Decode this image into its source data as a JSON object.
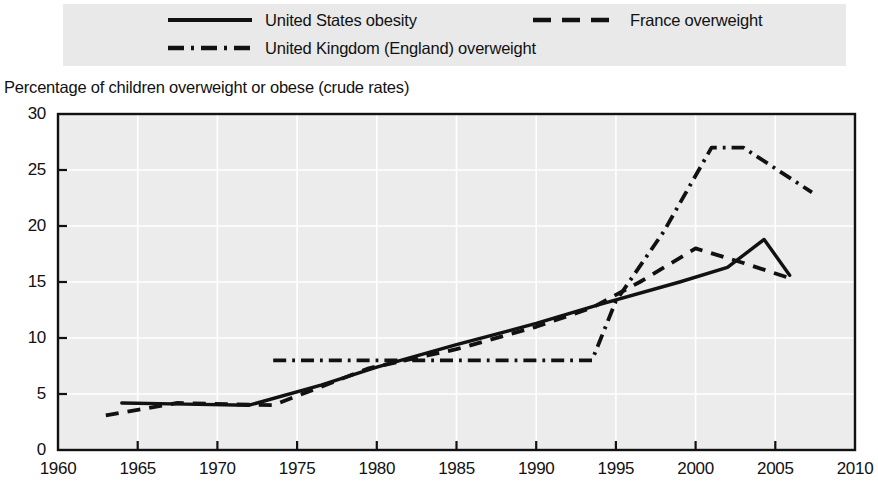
{
  "legend": {
    "entries": [
      {
        "label": "United States obesity",
        "style": "solid",
        "color": "#111111"
      },
      {
        "label": "France overweight",
        "style": "dashed",
        "color": "#111111"
      },
      {
        "label": "United Kingdom (England) overweight",
        "style": "dash-dot",
        "color": "#111111"
      }
    ],
    "background": "#e9e9e9"
  },
  "chart_data": {
    "type": "line",
    "title": "",
    "axis_title": "Percentage of children overweight or obese (crude rates)",
    "xlabel": "",
    "ylabel": "Percentage of children overweight or obese (crude rates)",
    "xlim": [
      1960,
      2010
    ],
    "ylim": [
      0,
      30
    ],
    "xticks": [
      1960,
      1965,
      1970,
      1975,
      1980,
      1985,
      1990,
      1995,
      2000,
      2005,
      2010
    ],
    "yticks": [
      0,
      5,
      10,
      15,
      20,
      25,
      30
    ],
    "grid": true,
    "grid_color": "#ffffff",
    "plot_background": "#ececec",
    "legend_position": "top",
    "series": [
      {
        "name": "United States obesity",
        "style": "solid",
        "color": "#111111",
        "points": [
          [
            1964.0,
            4.2
          ],
          [
            1968.0,
            4.1
          ],
          [
            1972.0,
            4.0
          ],
          [
            1976.5,
            5.8
          ],
          [
            1980.0,
            7.4
          ],
          [
            1985.0,
            9.4
          ],
          [
            1990.0,
            11.3
          ],
          [
            1994.0,
            13.0
          ],
          [
            1999.0,
            15.0
          ],
          [
            2002.0,
            16.3
          ],
          [
            2004.3,
            18.8
          ],
          [
            2005.9,
            15.6
          ]
        ]
      },
      {
        "name": "France overweight",
        "style": "dashed",
        "color": "#111111",
        "points": [
          [
            1963.0,
            3.1
          ],
          [
            1967.5,
            4.2
          ],
          [
            1973.5,
            4.0
          ],
          [
            1979.5,
            7.3
          ],
          [
            1985.0,
            9.0
          ],
          [
            1990.0,
            11.0
          ],
          [
            1993.5,
            12.7
          ],
          [
            1996.5,
            15.0
          ],
          [
            2000.0,
            18.0
          ],
          [
            2003.0,
            16.7
          ],
          [
            2006.0,
            15.3
          ]
        ]
      },
      {
        "name": "United Kingdom (England) overweight",
        "style": "dash-dot",
        "color": "#111111",
        "points": [
          [
            1973.5,
            8.0
          ],
          [
            1993.5,
            8.0
          ],
          [
            1995.0,
            13.3
          ],
          [
            1998.0,
            19.5
          ],
          [
            2001.0,
            27.0
          ],
          [
            2003.0,
            27.0
          ],
          [
            2007.3,
            23.0
          ]
        ]
      }
    ]
  }
}
